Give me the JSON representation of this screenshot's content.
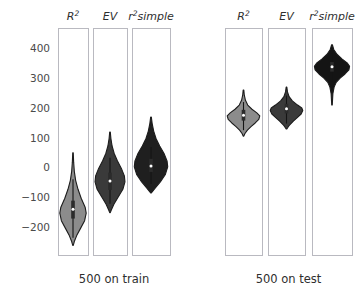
{
  "figure": {
    "background_color": "#ffffff",
    "frame_color": "#b9b9c0",
    "grid_color": "#e3e3e8"
  },
  "axis": {
    "ticks": [
      400,
      300,
      200,
      100,
      0,
      -100,
      -200
    ],
    "tick_labels": [
      "400",
      "300",
      "200",
      "100",
      "0",
      "−100",
      "−200"
    ],
    "ylim": [
      -290,
      470
    ]
  },
  "groups": [
    {
      "id": "train",
      "label": "500 on train"
    },
    {
      "id": "test",
      "label": "500 on test"
    }
  ],
  "columns": [
    {
      "key": "r2",
      "prefix": "R",
      "sup": "2",
      "suffix": ""
    },
    {
      "key": "ev",
      "prefix": "EV",
      "sup": "",
      "suffix": ""
    },
    {
      "key": "r2simple",
      "prefix": "r",
      "sup": "2",
      "suffix": "simple"
    }
  ],
  "chart_data": {
    "type": "violin",
    "title": "",
    "xlabel": "",
    "ylabel": "",
    "ylim": [
      -290,
      470
    ],
    "yticks": [
      400,
      300,
      200,
      100,
      0,
      -100,
      -200
    ],
    "grid": true,
    "legend": "none",
    "panel_labels_top": [
      "R²",
      "EV",
      "r²simple"
    ],
    "panel_labels_bottom": [
      "500 on train",
      "500 on test"
    ],
    "panels": [
      {
        "group": "500 on train",
        "metric": "R²",
        "fill_color": "#8c8c8c",
        "median": -137,
        "q1": -168,
        "q3": -108,
        "whisker_low": -232,
        "whisker_high": -36,
        "data_min": -258,
        "data_max": 52,
        "density": [
          {
            "y": 52,
            "w": 0.02
          },
          {
            "y": 20,
            "w": 0.05
          },
          {
            "y": -10,
            "w": 0.1
          },
          {
            "y": -40,
            "w": 0.2
          },
          {
            "y": -70,
            "w": 0.38
          },
          {
            "y": -100,
            "w": 0.62
          },
          {
            "y": -130,
            "w": 0.92
          },
          {
            "y": -150,
            "w": 1.0
          },
          {
            "y": -175,
            "w": 0.88
          },
          {
            "y": -200,
            "w": 0.58
          },
          {
            "y": -225,
            "w": 0.28
          },
          {
            "y": -245,
            "w": 0.1
          },
          {
            "y": -258,
            "w": 0.02
          }
        ]
      },
      {
        "group": "500 on train",
        "metric": "EV",
        "fill_color": "#3a3a3a",
        "median": -42,
        "q1": -72,
        "q3": -14,
        "whisker_low": -118,
        "whisker_high": 36,
        "data_min": -148,
        "data_max": 122,
        "density": [
          {
            "y": 122,
            "w": 0.02
          },
          {
            "y": 100,
            "w": 0.06
          },
          {
            "y": 75,
            "w": 0.14
          },
          {
            "y": 50,
            "w": 0.28
          },
          {
            "y": 25,
            "w": 0.5
          },
          {
            "y": 0,
            "w": 0.76
          },
          {
            "y": -25,
            "w": 0.96
          },
          {
            "y": -45,
            "w": 1.0
          },
          {
            "y": -70,
            "w": 0.86
          },
          {
            "y": -95,
            "w": 0.56
          },
          {
            "y": -120,
            "w": 0.26
          },
          {
            "y": -140,
            "w": 0.08
          },
          {
            "y": -148,
            "w": 0.02
          }
        ]
      },
      {
        "group": "500 on train",
        "metric": "r²simple",
        "fill_color": "#1f1f1f",
        "median": 8,
        "q1": -12,
        "q3": 32,
        "whisker_low": -52,
        "whisker_high": 72,
        "data_min": -82,
        "data_max": 172,
        "density": [
          {
            "y": 172,
            "w": 0.02
          },
          {
            "y": 150,
            "w": 0.07
          },
          {
            "y": 125,
            "w": 0.16
          },
          {
            "y": 100,
            "w": 0.3
          },
          {
            "y": 75,
            "w": 0.52
          },
          {
            "y": 50,
            "w": 0.78
          },
          {
            "y": 25,
            "w": 0.96
          },
          {
            "y": 5,
            "w": 1.0
          },
          {
            "y": -20,
            "w": 0.86
          },
          {
            "y": -45,
            "w": 0.56
          },
          {
            "y": -65,
            "w": 0.26
          },
          {
            "y": -78,
            "w": 0.08
          },
          {
            "y": -82,
            "w": 0.02
          }
        ]
      },
      {
        "group": "500 on test",
        "metric": "R²",
        "fill_color": "#8c8c8c",
        "median": 178,
        "q1": 160,
        "q3": 196,
        "whisker_low": 128,
        "whisker_high": 222,
        "data_min": 108,
        "data_max": 262,
        "density": [
          {
            "y": 262,
            "w": 0.02
          },
          {
            "y": 245,
            "w": 0.05
          },
          {
            "y": 228,
            "w": 0.12
          },
          {
            "y": 212,
            "w": 0.26
          },
          {
            "y": 198,
            "w": 0.52
          },
          {
            "y": 186,
            "w": 0.82
          },
          {
            "y": 176,
            "w": 1.0
          },
          {
            "y": 164,
            "w": 0.94
          },
          {
            "y": 152,
            "w": 0.72
          },
          {
            "y": 140,
            "w": 0.46
          },
          {
            "y": 128,
            "w": 0.24
          },
          {
            "y": 116,
            "w": 0.08
          },
          {
            "y": 108,
            "w": 0.02
          }
        ]
      },
      {
        "group": "500 on test",
        "metric": "EV",
        "fill_color": "#3a3a3a",
        "median": 200,
        "q1": 184,
        "q3": 216,
        "whisker_low": 150,
        "whisker_high": 244,
        "data_min": 132,
        "data_max": 272,
        "density": [
          {
            "y": 272,
            "w": 0.02
          },
          {
            "y": 256,
            "w": 0.06
          },
          {
            "y": 240,
            "w": 0.16
          },
          {
            "y": 226,
            "w": 0.36
          },
          {
            "y": 212,
            "w": 0.68
          },
          {
            "y": 202,
            "w": 0.94
          },
          {
            "y": 194,
            "w": 1.0
          },
          {
            "y": 182,
            "w": 0.9
          },
          {
            "y": 170,
            "w": 0.66
          },
          {
            "y": 158,
            "w": 0.42
          },
          {
            "y": 146,
            "w": 0.2
          },
          {
            "y": 136,
            "w": 0.07
          },
          {
            "y": 132,
            "w": 0.02
          }
        ]
      },
      {
        "group": "500 on test",
        "metric": "r²simple",
        "fill_color": "#141414",
        "median": 340,
        "q1": 324,
        "q3": 356,
        "whisker_low": 292,
        "whisker_high": 384,
        "data_min": 212,
        "data_max": 414,
        "density": [
          {
            "y": 414,
            "w": 0.02
          },
          {
            "y": 398,
            "w": 0.1
          },
          {
            "y": 382,
            "w": 0.28
          },
          {
            "y": 366,
            "w": 0.58
          },
          {
            "y": 352,
            "w": 0.88
          },
          {
            "y": 342,
            "w": 1.0
          },
          {
            "y": 330,
            "w": 0.96
          },
          {
            "y": 316,
            "w": 0.74
          },
          {
            "y": 302,
            "w": 0.46
          },
          {
            "y": 288,
            "w": 0.24
          },
          {
            "y": 272,
            "w": 0.12
          },
          {
            "y": 250,
            "w": 0.05
          },
          {
            "y": 212,
            "w": 0.015
          }
        ]
      }
    ]
  }
}
